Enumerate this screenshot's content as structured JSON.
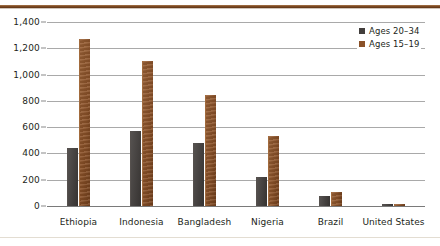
{
  "decor": {
    "top_rule_color": "#7d4a23",
    "bottom_rule_color": "#e3ddd2"
  },
  "legend": {
    "position": "top-right",
    "entries": [
      {
        "label": "Ages 20–34",
        "color": "#423e3c",
        "swatch": "legend-swatch-ages-20-34"
      },
      {
        "label": "Ages 15–19",
        "color": "#8a5128",
        "swatch": "legend-swatch-ages-15-19"
      }
    ]
  },
  "chart_data": {
    "type": "bar",
    "title": "",
    "xlabel": "",
    "ylabel": "",
    "ylim": [
      0,
      1400
    ],
    "yticks": [
      0,
      200,
      400,
      600,
      800,
      1000,
      1200,
      1400
    ],
    "ytick_labels": [
      "0",
      "200",
      "400",
      "600",
      "800",
      "1,000",
      "1,200",
      "1,400"
    ],
    "grid": true,
    "legend_position": "top-right",
    "categories": [
      "Ethiopia",
      "Indonesia",
      "Bangladesh",
      "Nigeria",
      "Brazil",
      "United States"
    ],
    "series": [
      {
        "name": "Ages 20–34",
        "color": "#423e3c",
        "values": [
          440,
          570,
          480,
          220,
          80,
          6
        ]
      },
      {
        "name": "Ages 15–19",
        "color": "#8a5128",
        "values": [
          1270,
          1100,
          845,
          530,
          110,
          8
        ]
      }
    ]
  }
}
